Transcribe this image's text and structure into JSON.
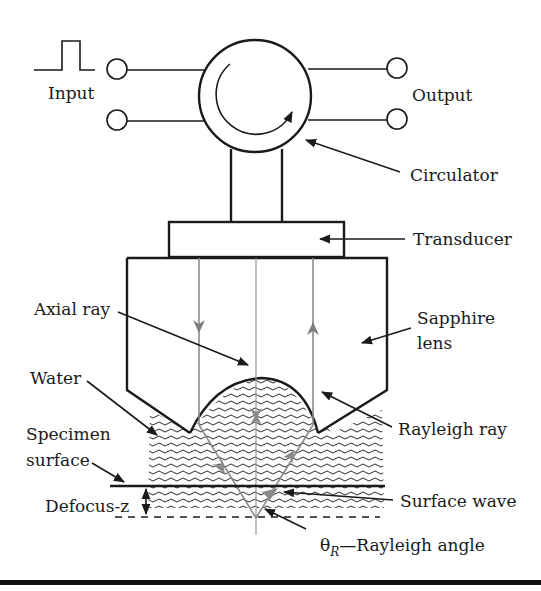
{
  "figure": {
    "labels": {
      "input": "Input",
      "output": "Output",
      "circulator": "Circulator",
      "transducer": "Transducer",
      "axial_ray": "Axial ray",
      "sapphire_lens_line1": "Sapphire",
      "sapphire_lens_line2": "lens",
      "water": "Water",
      "rayleigh_ray": "Rayleigh ray",
      "specimen_surface_line1": "Specimen",
      "specimen_surface_line2": "surface",
      "defocus": "Defocus-z",
      "surface_wave": "Surface wave",
      "rayleigh_angle_symbol": "θ",
      "rayleigh_angle_subscript": "R",
      "rayleigh_angle_text": "—Rayleigh angle"
    },
    "components": [
      "input-pulse",
      "input-terminals",
      "circulator",
      "output-terminals",
      "transducer",
      "sapphire-lens",
      "water-coupling",
      "specimen-surface",
      "focal-plane"
    ],
    "colors": {
      "ink": "#1a1a1a",
      "ray_gray": "#8a8a8a",
      "background": "#ffffff"
    }
  }
}
